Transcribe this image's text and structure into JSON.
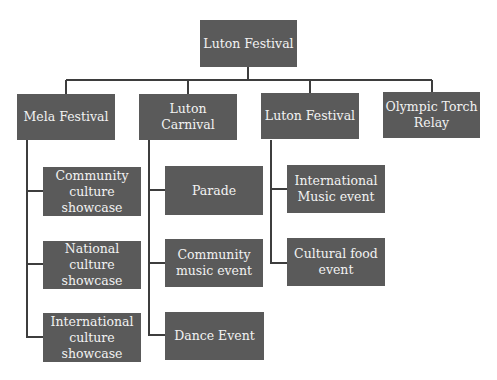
{
  "diagram": {
    "type": "org-chart",
    "root": {
      "label": "Luton Festival"
    },
    "branches": [
      {
        "label": "Mela Festival",
        "children": [
          {
            "label": "Community\nculture\nshowcase"
          },
          {
            "label": "National culture\nshowcase"
          },
          {
            "label": "International\nculture\nshowcase"
          }
        ]
      },
      {
        "label": "Luton Carnival",
        "children": [
          {
            "label": "Parade"
          },
          {
            "label": "Community\nmusic event"
          },
          {
            "label": "Dance Event"
          }
        ]
      },
      {
        "label": "Luton Festival",
        "children": [
          {
            "label": "International\nMusic event"
          },
          {
            "label": "Cultural food\nevent"
          }
        ]
      },
      {
        "label": "Olympic Torch\nRelay",
        "children": []
      }
    ],
    "colors": {
      "box_fill": "#5a5a5a",
      "box_text": "#f2f2f2",
      "connector": "#3d3d3d",
      "background": "#ffffff"
    }
  }
}
